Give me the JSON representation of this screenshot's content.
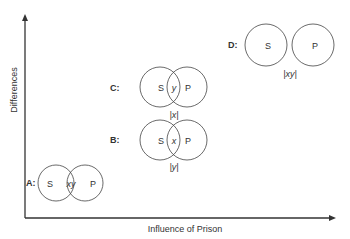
{
  "axes": {
    "x_label": "Influence of Prison",
    "y_label": "Differences"
  },
  "panels": [
    {
      "id": "A",
      "label": "A:",
      "left": "S",
      "right": "P",
      "overlap_text": "xy",
      "below_text": ""
    },
    {
      "id": "B",
      "label": "B:",
      "left": "S",
      "right": "P",
      "overlap_text": "x",
      "below_text": "|y|"
    },
    {
      "id": "C",
      "label": "C:",
      "left": "S",
      "right": "P",
      "overlap_text": "y",
      "below_text": "|x|"
    },
    {
      "id": "D",
      "label": "D:",
      "left": "S",
      "right": "P",
      "overlap_text": "",
      "below_text": "|xy|"
    }
  ],
  "colors": {
    "stroke": "#444444",
    "text": "#333333",
    "background": "#ffffff"
  }
}
